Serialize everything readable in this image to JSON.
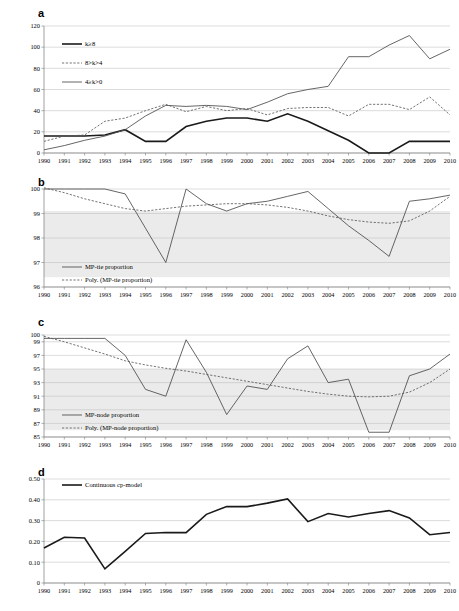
{
  "figure": {
    "panels": [
      "a",
      "b",
      "c",
      "d"
    ]
  },
  "chart_data": [
    {
      "panel": "a",
      "type": "line",
      "title": "",
      "xlabel": "",
      "ylabel": "",
      "grid": true,
      "legend_position": "upper-left",
      "x": [
        1990,
        1991,
        1992,
        1993,
        1994,
        1995,
        1996,
        1997,
        1998,
        1999,
        2000,
        2001,
        2002,
        2003,
        2004,
        2005,
        2006,
        2007,
        2008,
        2009,
        2010
      ],
      "xlim": [
        1990,
        2010
      ],
      "ylim": [
        0,
        120
      ],
      "yticks": [
        0,
        20,
        40,
        60,
        80,
        100,
        120
      ],
      "xticklabels": [
        "1990",
        "1991",
        "1992",
        "1993",
        "1994",
        "1995",
        "1996",
        "1997",
        "1998",
        "1999",
        "2000",
        "2001",
        "2002",
        "2003",
        "2004",
        "2005",
        "2006",
        "2007",
        "2008",
        "2009",
        "2010"
      ],
      "series": [
        {
          "name": "k≥8",
          "style": "solid-dark",
          "values": [
            16,
            16,
            16,
            17,
            22,
            11,
            11,
            25,
            30,
            33,
            33,
            30,
            37,
            30,
            21,
            12,
            0,
            0,
            11,
            11,
            11
          ]
        },
        {
          "name": "8>k>4",
          "style": "dashed",
          "values": [
            11,
            16,
            17,
            30,
            33,
            40,
            46,
            39,
            44,
            40,
            42,
            36,
            42,
            43,
            43,
            35,
            46,
            46,
            41,
            53,
            36
          ]
        },
        {
          "name": "4≥k>0",
          "style": "solid-mid",
          "values": [
            3,
            7,
            12,
            16,
            22,
            35,
            45,
            44,
            45,
            44,
            41,
            48,
            56,
            60,
            63,
            91,
            91,
            102,
            111,
            89,
            98
          ]
        }
      ]
    },
    {
      "panel": "b",
      "type": "line",
      "title": "",
      "xlabel": "",
      "ylabel": "",
      "grid": true,
      "legend_position": "lower-left",
      "x": [
        1990,
        1991,
        1992,
        1993,
        1994,
        1995,
        1996,
        1997,
        1998,
        1999,
        2000,
        2001,
        2002,
        2003,
        2004,
        2005,
        2006,
        2007,
        2008,
        2009,
        2010
      ],
      "xlim": [
        1990,
        2010
      ],
      "ylim": [
        96,
        100
      ],
      "yticks": [
        96,
        97,
        98,
        99,
        100
      ],
      "xticklabels": [
        "1990",
        "1991",
        "1992",
        "1993",
        "1994",
        "1995",
        "1996",
        "1997",
        "1998",
        "1999",
        "2000",
        "2001",
        "2002",
        "2003",
        "2004",
        "2005",
        "2006",
        "2007",
        "2008",
        "2009",
        "2010"
      ],
      "shaded_band": [
        96.4,
        99.1
      ],
      "series": [
        {
          "name": "MP-tie proportion",
          "style": "solid-thin",
          "values": [
            100,
            100,
            100,
            100,
            99.8,
            98.4,
            97.0,
            100,
            99.4,
            99.1,
            99.4,
            99.5,
            99.7,
            99.9,
            99.2,
            98.5,
            97.9,
            97.25,
            99.5,
            99.6,
            99.75
          ]
        },
        {
          "name": "Poly. (MP-tie proportion)",
          "style": "dashed",
          "values": [
            100.05,
            99.85,
            99.6,
            99.4,
            99.2,
            99.1,
            99.2,
            99.3,
            99.35,
            99.4,
            99.4,
            99.35,
            99.25,
            99.1,
            98.9,
            98.75,
            98.65,
            98.6,
            98.7,
            99.1,
            99.7
          ]
        }
      ]
    },
    {
      "panel": "c",
      "type": "line",
      "title": "",
      "xlabel": "",
      "ylabel": "",
      "grid": true,
      "legend_position": "lower-left",
      "x": [
        1990,
        1991,
        1992,
        1993,
        1994,
        1995,
        1996,
        1997,
        1998,
        1999,
        2000,
        2001,
        2002,
        2003,
        2004,
        2005,
        2006,
        2007,
        2008,
        2009,
        2010
      ],
      "xlim": [
        1990,
        2010
      ],
      "ylim": [
        85,
        100
      ],
      "yticks": [
        85,
        87,
        89,
        91,
        93,
        95,
        97,
        99,
        100
      ],
      "xticklabels": [
        "1990",
        "1991",
        "1992",
        "1993",
        "1994",
        "1995",
        "1996",
        "1997",
        "1998",
        "1999",
        "2000",
        "2001",
        "2002",
        "2003",
        "2004",
        "2005",
        "2006",
        "2007",
        "2008",
        "2009",
        "2010"
      ],
      "shaded_band": [
        86.0,
        95.0
      ],
      "series": [
        {
          "name": "MP-node proportion",
          "style": "solid-thin",
          "values": [
            99.5,
            99.5,
            99.5,
            99.5,
            97.0,
            92.0,
            91.0,
            99.3,
            94.5,
            88.3,
            92.5,
            92.0,
            96.5,
            98.4,
            93.0,
            93.5,
            85.7,
            85.7,
            94.0,
            95.0,
            97.2
          ]
        },
        {
          "name": "Poly. (MP-node proportion)",
          "style": "dashed",
          "values": [
            99.8,
            99.0,
            98.1,
            97.2,
            96.2,
            95.6,
            95.1,
            94.7,
            94.2,
            93.7,
            93.2,
            92.7,
            92.2,
            91.7,
            91.3,
            91.0,
            90.9,
            91.0,
            91.6,
            93.0,
            95.0
          ]
        }
      ]
    },
    {
      "panel": "d",
      "type": "line",
      "title": "",
      "xlabel": "",
      "ylabel": "",
      "grid": true,
      "legend_position": "upper-left",
      "x": [
        1990,
        1991,
        1992,
        1993,
        1994,
        1995,
        1996,
        1997,
        1998,
        1999,
        2000,
        2001,
        2002,
        2003,
        2004,
        2005,
        2006,
        2007,
        2008,
        2009,
        2010
      ],
      "xlim": [
        1990,
        2010
      ],
      "ylim": [
        0,
        0.5
      ],
      "yticks": [
        0,
        0.1,
        0.2,
        0.3,
        0.4,
        0.5
      ],
      "ytickformat": [
        "0",
        "0.10",
        "0.20",
        "0.30",
        "0.40",
        "0.50"
      ],
      "xticklabels": [
        "1990",
        "1991",
        "1992",
        "1993",
        "1994",
        "1995",
        "1996",
        "1997",
        "1998",
        "1999",
        "2000",
        "2001",
        "2002",
        "2003",
        "2004",
        "2005",
        "2006",
        "2007",
        "2008",
        "2009",
        "2010"
      ],
      "series": [
        {
          "name": "Continuous cp-model",
          "style": "solid-dark",
          "values": [
            0.168,
            0.22,
            0.216,
            0.068,
            0.152,
            0.238,
            0.243,
            0.242,
            0.33,
            0.368,
            0.367,
            0.384,
            0.404,
            0.295,
            0.334,
            0.317,
            0.334,
            0.348,
            0.313,
            0.232,
            0.243
          ]
        }
      ]
    }
  ]
}
